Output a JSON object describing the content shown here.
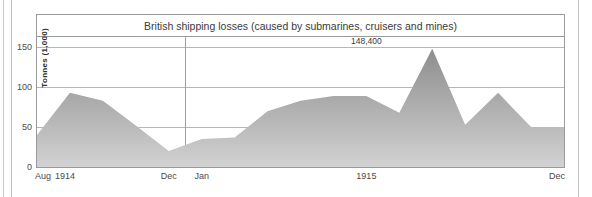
{
  "chart_data": {
    "type": "area",
    "title": "British shipping losses (caused by submarines, cruisers and mines)",
    "ylabel": "Tonnes  (1,000)",
    "xlabel": "",
    "ylim": [
      0,
      163
    ],
    "yticks": [
      0,
      50,
      100,
      150
    ],
    "ytick_labels": [
      "0",
      "50",
      "100",
      "150"
    ],
    "grid": true,
    "legend": "none",
    "annotations": [
      {
        "text": "148,400",
        "x_index": 10,
        "value": 148.4
      }
    ],
    "x_tick_labels": [
      {
        "label": "Aug",
        "x_index": 0
      },
      {
        "label": "1914",
        "x_index": 0.85
      },
      {
        "label": "Dec",
        "x_index": 4
      },
      {
        "label": "Jan",
        "x_index": 5
      },
      {
        "label": "1915",
        "x_index": 10
      },
      {
        "label": "Dec",
        "x_index": 16
      }
    ],
    "categories": [
      "Aug 1914",
      "Sep 1914",
      "Oct 1914",
      "Nov 1914",
      "Dec 1914",
      "Jan 1915",
      "Feb 1915",
      "Mar 1915",
      "Apr 1915",
      "May 1915",
      "Jun 1915",
      "Jul 1915",
      "Aug 1915",
      "Sep 1915",
      "Oct 1915",
      "Nov 1915",
      "Dec 1915"
    ],
    "values": [
      40,
      93,
      83,
      52,
      20,
      35,
      37,
      70,
      83,
      89,
      89,
      68,
      148.4,
      53,
      93,
      50,
      50
    ],
    "series": [
      {
        "name": "British shipping losses",
        "values": [
          40,
          93,
          83,
          52,
          20,
          35,
          37,
          70,
          83,
          89,
          89,
          68,
          148.4,
          53,
          93,
          50,
          50
        ]
      }
    ],
    "colors": {
      "fill_top": "#8d8d8d",
      "fill_bottom": "#cfcfcf",
      "frame": "#9a9a9a",
      "grid": "#b6b6b6",
      "text": "#3a3a3a"
    }
  }
}
